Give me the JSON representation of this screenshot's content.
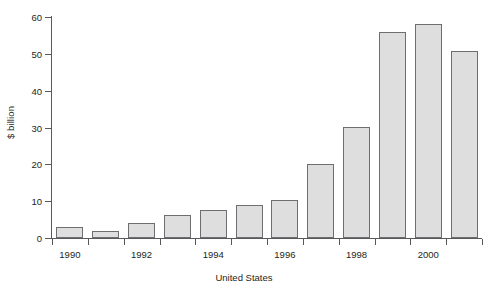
{
  "chart_data": {
    "type": "bar",
    "title": "",
    "subtitle": "",
    "xlabel": "United States",
    "ylabel": "$ billion",
    "categories": [
      "1990",
      "1991",
      "1992",
      "1993",
      "1994",
      "1995",
      "1996",
      "1997",
      "1998",
      "1999",
      "2000",
      "2001"
    ],
    "values": [
      3,
      2,
      4,
      6.3,
      7.5,
      9,
      10.3,
      20,
      30.2,
      56,
      58.2,
      50.8
    ],
    "xtick_labels": [
      "1990",
      "1992",
      "1994",
      "1996",
      "1998",
      "2000"
    ],
    "ytick_labels": [
      "0",
      "10",
      "20",
      "30",
      "40",
      "50",
      "60"
    ],
    "ylim": [
      0,
      60
    ],
    "grid": false,
    "legend": "none",
    "bar_fill_color": "#dedede",
    "bar_border_color": "#6d6e71",
    "axis_color": "#58595b",
    "text_color": "#231f20"
  }
}
